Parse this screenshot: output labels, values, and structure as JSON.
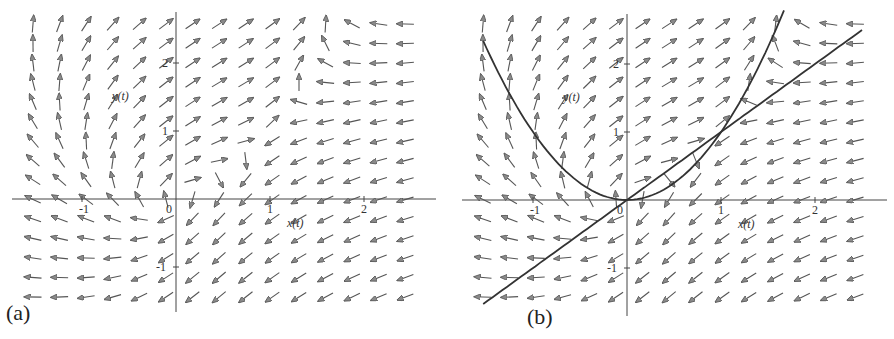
{
  "figure": {
    "panels": [
      {
        "id": "a",
        "label": "(a)"
      },
      {
        "id": "b",
        "label": "(b)"
      }
    ]
  },
  "chart_data": [
    {
      "type": "quiver",
      "panel_label": "(a)",
      "title": "",
      "system": {
        "dx": "y - x^2",
        "dy": "y - x"
      },
      "xlabel": "x(t)",
      "ylabel": "y(t)",
      "xlim": [
        -1.5,
        2.6
      ],
      "ylim": [
        -1.6,
        2.7
      ],
      "xticks": [
        -1,
        0,
        1,
        2
      ],
      "xtick_labels": [
        "-1",
        "0",
        "1",
        "2"
      ],
      "yticks": [
        -1,
        1,
        2
      ],
      "ytick_labels": [
        "-1",
        "1",
        "2"
      ],
      "grid": false,
      "arrows": {
        "cols": 15,
        "rows": 15,
        "normalized": true,
        "color": "#555555"
      },
      "curves": []
    },
    {
      "type": "quiver",
      "panel_label": "(b)",
      "title": "",
      "system": {
        "dx": "y - x^2",
        "dy": "y - x"
      },
      "xlabel": "x(t)",
      "ylabel": "y(t)",
      "xlim": [
        -1.5,
        2.6
      ],
      "ylim": [
        -1.6,
        2.7
      ],
      "xticks": [
        -1,
        0,
        1,
        2
      ],
      "xtick_labels": [
        "-1",
        "0",
        "1",
        "2"
      ],
      "yticks": [
        -1,
        1,
        2
      ],
      "ytick_labels": [
        "-1",
        "1",
        "2"
      ],
      "grid": false,
      "arrows": {
        "cols": 15,
        "rows": 15,
        "normalized": true,
        "color": "#555555"
      },
      "curves": [
        {
          "name": "nullcline y = x^2",
          "kind": "parabola",
          "x_range": [
            -1.53,
            1.67
          ],
          "color": "#333333"
        },
        {
          "name": "nullcline y = x",
          "kind": "line",
          "x_range": [
            -1.53,
            2.5
          ],
          "color": "#333333"
        }
      ]
    }
  ]
}
